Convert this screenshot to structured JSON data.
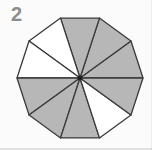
{
  "question_number": "2",
  "colors": {
    "shaded_fill": "#b7b7b7",
    "unshaded_fill": "#ffffff",
    "stroke": "#3a3a3a",
    "center_dot": "#1f1f1f",
    "card_background": "#fbfbfb",
    "label_color": "#8c8c8c"
  },
  "chart_data": {
    "type": "fraction-shading-diagram",
    "shape": "regular-decagon",
    "total_parts": 10,
    "shaded_parts": 7,
    "unshaded_parts": 3,
    "shaded_fraction": "7/10",
    "sectors": [
      {
        "index": 0,
        "start_angle_deg": 0,
        "end_angle_deg": 36,
        "position": "right-upper",
        "shaded": true
      },
      {
        "index": 1,
        "start_angle_deg": 36,
        "end_angle_deg": 72,
        "position": "upper-right",
        "shaded": true
      },
      {
        "index": 2,
        "start_angle_deg": 72,
        "end_angle_deg": 108,
        "position": "top",
        "shaded": true
      },
      {
        "index": 3,
        "start_angle_deg": 108,
        "end_angle_deg": 144,
        "position": "upper-left",
        "shaded": false
      },
      {
        "index": 4,
        "start_angle_deg": 144,
        "end_angle_deg": 180,
        "position": "left-upper",
        "shaded": false
      },
      {
        "index": 5,
        "start_angle_deg": 180,
        "end_angle_deg": 216,
        "position": "left-lower",
        "shaded": true
      },
      {
        "index": 6,
        "start_angle_deg": 216,
        "end_angle_deg": 252,
        "position": "lower-left",
        "shaded": true
      },
      {
        "index": 7,
        "start_angle_deg": 252,
        "end_angle_deg": 288,
        "position": "bottom",
        "shaded": true
      },
      {
        "index": 8,
        "start_angle_deg": 288,
        "end_angle_deg": 324,
        "position": "lower-right",
        "shaded": false
      },
      {
        "index": 9,
        "start_angle_deg": 324,
        "end_angle_deg": 360,
        "position": "right-lower",
        "shaded": true
      }
    ]
  },
  "diagram": {
    "center_x": 80,
    "center_y": 78,
    "radius": 63,
    "center_dot_radius": 2.4,
    "stroke_width": 1.3
  }
}
